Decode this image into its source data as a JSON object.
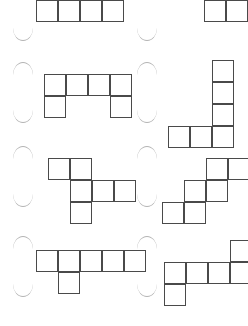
{
  "page": {
    "background_color": "#ffffff",
    "stroke_color": "#4a4a4a",
    "arc_color": "#9a9a9a",
    "width": 248,
    "height": 326,
    "columns": 2,
    "rows": 4,
    "cell_size": 22,
    "note": "Top row of shapes is cropped by the image edge"
  },
  "shapes": [
    {
      "id": "shape-1",
      "name": "row1-col1-shape",
      "cell_count": 7,
      "grid": [
        [
          0,
          0
        ],
        [
          1,
          0
        ],
        [
          2,
          0
        ],
        [
          0,
          1
        ],
        [
          1,
          1
        ],
        [
          2,
          1
        ],
        [
          3,
          1
        ]
      ],
      "origin_x": 36,
      "origin_y": -22,
      "description": "two stacked rows offset, lower row of four"
    },
    {
      "id": "shape-2",
      "name": "row1-col2-shape",
      "cell_count": 6,
      "grid": [
        [
          0,
          0
        ],
        [
          1,
          0
        ],
        [
          2,
          0
        ],
        [
          2,
          1
        ],
        [
          3,
          1
        ]
      ],
      "origin_x": 160,
      "origin_y": -22,
      "description": "top row of three with two cells stepping down right"
    },
    {
      "id": "shape-3",
      "name": "row2-col1-shape",
      "cell_count": 6,
      "grid": [
        [
          0,
          0
        ],
        [
          1,
          0
        ],
        [
          2,
          0
        ],
        [
          3,
          0
        ],
        [
          0,
          1
        ],
        [
          3,
          1
        ]
      ],
      "origin_x": 44,
      "origin_y": 74,
      "description": "U shape, four wide with two legs"
    },
    {
      "id": "shape-4",
      "name": "row2-col2-shape",
      "cell_count": 6,
      "grid": [
        [
          2,
          0
        ],
        [
          2,
          1
        ],
        [
          2,
          2
        ],
        [
          0,
          3
        ],
        [
          1,
          3
        ],
        [
          2,
          3
        ]
      ],
      "origin_x": 168,
      "origin_y": 60,
      "description": "L shape, column of four with two cells left at base"
    },
    {
      "id": "shape-5",
      "name": "row3-col1-shape",
      "cell_count": 6,
      "grid": [
        [
          0,
          0
        ],
        [
          1,
          0
        ],
        [
          1,
          1
        ],
        [
          2,
          1
        ],
        [
          3,
          1
        ],
        [
          1,
          2
        ]
      ],
      "origin_x": 48,
      "origin_y": 158,
      "description": "cross-like shape with arms right and down"
    },
    {
      "id": "shape-6",
      "name": "row3-col2-shape",
      "cell_count": 6,
      "grid": [
        [
          2,
          0
        ],
        [
          3,
          0
        ],
        [
          1,
          1
        ],
        [
          2,
          1
        ],
        [
          0,
          2
        ],
        [
          1,
          2
        ]
      ],
      "origin_x": 162,
      "origin_y": 158,
      "description": "W staircase of three offset pairs"
    },
    {
      "id": "shape-7",
      "name": "row4-col1-shape",
      "cell_count": 6,
      "grid": [
        [
          0,
          0
        ],
        [
          1,
          0
        ],
        [
          2,
          0
        ],
        [
          3,
          0
        ],
        [
          4,
          0
        ],
        [
          1,
          1
        ]
      ],
      "origin_x": 36,
      "origin_y": 250,
      "description": "row of five with one cell below second"
    },
    {
      "id": "shape-8",
      "name": "row4-col2-shape",
      "cell_count": 6,
      "grid": [
        [
          3,
          0
        ],
        [
          0,
          1
        ],
        [
          1,
          1
        ],
        [
          2,
          1
        ],
        [
          3,
          1
        ],
        [
          0,
          2
        ]
      ],
      "origin_x": 164,
      "origin_y": 240,
      "description": "Z/S shape, row of four with cells above right and below left"
    }
  ],
  "arcs": [
    {
      "name": "arc-r1-c1",
      "x": 13,
      "y": 28,
      "direction": "down"
    },
    {
      "name": "arc-r1-c2",
      "x": 137,
      "y": 28,
      "direction": "down"
    },
    {
      "name": "arc-r2-c1-top",
      "x": 13,
      "y": 62,
      "direction": "up"
    },
    {
      "name": "arc-r2-c1-bottom",
      "x": 13,
      "y": 110,
      "direction": "down"
    },
    {
      "name": "arc-r2-c2-top",
      "x": 137,
      "y": 62,
      "direction": "up"
    },
    {
      "name": "arc-r2-c2-bottom",
      "x": 137,
      "y": 110,
      "direction": "down"
    },
    {
      "name": "arc-r3-c1-top",
      "x": 13,
      "y": 146,
      "direction": "up"
    },
    {
      "name": "arc-r3-c1-bottom",
      "x": 13,
      "y": 194,
      "direction": "down"
    },
    {
      "name": "arc-r3-c2-top",
      "x": 137,
      "y": 146,
      "direction": "up"
    },
    {
      "name": "arc-r3-c2-bottom",
      "x": 137,
      "y": 194,
      "direction": "down"
    },
    {
      "name": "arc-r4-c1-top",
      "x": 13,
      "y": 236,
      "direction": "up"
    },
    {
      "name": "arc-r4-c1-bottom",
      "x": 13,
      "y": 284,
      "direction": "down"
    },
    {
      "name": "arc-r4-c2-top",
      "x": 137,
      "y": 236,
      "direction": "up"
    },
    {
      "name": "arc-r4-c2-bottom",
      "x": 137,
      "y": 284,
      "direction": "down"
    }
  ]
}
